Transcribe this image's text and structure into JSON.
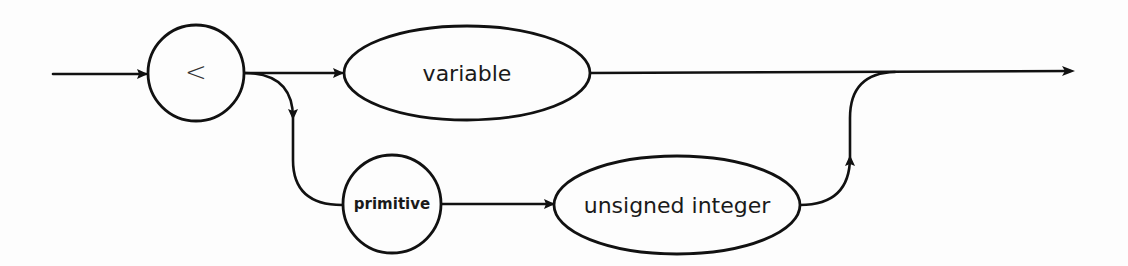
{
  "diagram": {
    "type": "syntax-railroad-diagram",
    "nodes": [
      {
        "id": "lt",
        "shape": "circle",
        "label": "<",
        "kind": "terminal"
      },
      {
        "id": "variable",
        "shape": "ellipse",
        "label": "variable",
        "kind": "nonterminal"
      },
      {
        "id": "primitive",
        "shape": "circle",
        "label": "primitive",
        "kind": "keyword"
      },
      {
        "id": "unsigned_integer",
        "shape": "ellipse",
        "label": "unsigned integer",
        "kind": "nonterminal"
      }
    ],
    "edges": [
      {
        "from": "entry",
        "to": "lt"
      },
      {
        "from": "lt",
        "to": "variable"
      },
      {
        "from": "lt",
        "to": "primitive"
      },
      {
        "from": "primitive",
        "to": "unsigned_integer"
      },
      {
        "from": "variable",
        "to": "exit"
      },
      {
        "from": "unsigned_integer",
        "to": "exit"
      }
    ],
    "colors": {
      "stroke": "#111111",
      "background": "#fdfdfd"
    }
  }
}
